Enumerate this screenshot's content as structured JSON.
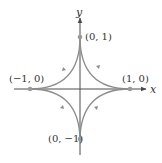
{
  "diagram": {
    "type": "astroid-parametric-curve",
    "axes": {
      "x_label": "x",
      "y_label": "y",
      "axis_color": "#4a4a4a"
    },
    "curve": {
      "color": "#8c8c8c",
      "orientation": "counterclockwise"
    },
    "points": [
      {
        "label": "(0, 1)",
        "x": 0,
        "y": 1
      },
      {
        "label": "(1, 0)",
        "x": 1,
        "y": 0
      },
      {
        "label": "(−1, 0)",
        "x": -1,
        "y": 0
      },
      {
        "label": "(0, −1)",
        "x": 0,
        "y": -1
      }
    ]
  }
}
